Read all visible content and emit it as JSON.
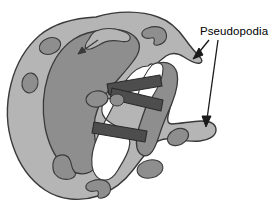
{
  "figure": {
    "background_color": "#ffffff"
  },
  "labels": [
    {
      "id": "pseudopodia",
      "text": "Pseudopodia",
      "x": 200,
      "y": 34,
      "font_size": 11.5,
      "color": "#000000"
    }
  ],
  "leader_lines": [
    {
      "id": "upper-arrow",
      "from_x": 208,
      "from_y": 39,
      "to_x": 194,
      "to_y": 57,
      "points_to": "upper-right-pseudopod",
      "color": "#1a1a1a"
    },
    {
      "id": "lower-arrow",
      "from_x": 217,
      "from_y": 39,
      "to_x": 207,
      "to_y": 126,
      "points_to": "lower-right-pseudopod",
      "color": "#1a1a1a"
    }
  ],
  "internal_arrows": [
    {
      "id": "cytoplasmic-streaming-arrow",
      "from_x": 81,
      "from_y": 52,
      "to_x": 97,
      "to_y": 41,
      "color": "#3a3a3a"
    }
  ],
  "colors": {
    "ectoplasm": "#b5b5b5",
    "endoplasm": "#8e8e8e",
    "vacuole_fill": "#8e8e8e",
    "food_vacuole": "#ffffff",
    "food_particle": "#4d4d4d",
    "outline": "#3a3a3a",
    "label": "#000000",
    "background": "#ffffff"
  },
  "structures": {
    "cell_body_name": "amoeba-cell-body",
    "ectoplasm_name": "ectoplasm-outer-cytoplasm",
    "endoplasm_name": "endoplasm-inner-cytoplasm",
    "food_vacuole_name": "food-vacuole",
    "food_particles_count": 3,
    "small_vacuoles_count": 9,
    "pseudopodia_count": 2
  }
}
